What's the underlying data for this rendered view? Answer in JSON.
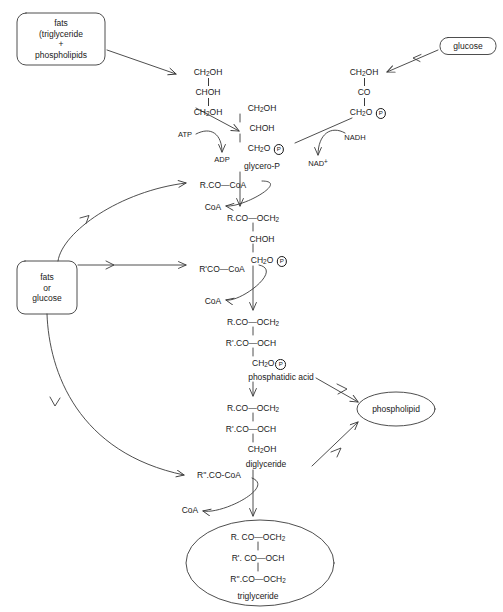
{
  "diagram": {
    "stroke_color": "#3a3a3a",
    "text_color": "#1a1a1a",
    "background": "#ffffff"
  },
  "boxes": [
    {
      "id": "fats-phospholipids",
      "shape": "rounded-rect",
      "lines": [
        "fats",
        "(triglyceride",
        "+",
        "phospholipids"
      ],
      "x": 61,
      "y": 39,
      "w": 88,
      "h": 52
    },
    {
      "id": "glucose",
      "shape": "rounded-rect",
      "lines": [
        "glucose"
      ],
      "x": 468,
      "y": 46,
      "w": 56,
      "h": 17
    },
    {
      "id": "fats-or-glucose",
      "shape": "rounded-rect",
      "lines": [
        "fats",
        "or",
        "glucose"
      ],
      "x": 47,
      "y": 288,
      "w": 60,
      "h": 53
    },
    {
      "id": "phospholipid",
      "shape": "ellipse",
      "lines": [
        "phospholipid"
      ],
      "x": 396,
      "y": 409,
      "w": 78,
      "h": 34
    },
    {
      "id": "triglyceride",
      "shape": "ellipse",
      "lines": [],
      "x": 260,
      "y": 563,
      "w": 148,
      "h": 86
    }
  ],
  "labels": [
    {
      "id": "glycerol-c1",
      "text": "CH2OH",
      "x": 208,
      "y": 73,
      "align": "center"
    },
    {
      "id": "glycerol-c2",
      "text": "CHOH",
      "x": 208,
      "y": 93,
      "align": "center"
    },
    {
      "id": "glycerol-c3",
      "text": "CH2OH",
      "x": 208,
      "y": 113,
      "align": "center"
    },
    {
      "id": "atp",
      "text": "ATP",
      "x": 185,
      "y": 135,
      "align": "center"
    },
    {
      "id": "adp",
      "text": "ADP",
      "x": 222,
      "y": 160,
      "align": "center"
    },
    {
      "id": "glycerop-c1",
      "text": "CH2OH",
      "x": 262,
      "y": 109,
      "align": "center"
    },
    {
      "id": "glycerop-c2",
      "text": "CHOH",
      "x": 262,
      "y": 129,
      "align": "center"
    },
    {
      "id": "glycerop-c3",
      "text": "CH2O P",
      "x": 262,
      "y": 149,
      "align": "center"
    },
    {
      "id": "glycerop-name",
      "text": "glycero-P",
      "x": 262,
      "y": 166,
      "align": "center"
    },
    {
      "id": "dhap-c1",
      "text": "CH2OH",
      "x": 364,
      "y": 73,
      "align": "center"
    },
    {
      "id": "dhap-c2",
      "text": "CO",
      "x": 364,
      "y": 93,
      "align": "center"
    },
    {
      "id": "dhap-c3",
      "text": "CH2O P",
      "x": 364,
      "y": 113,
      "align": "center"
    },
    {
      "id": "nadh",
      "text": "NADH",
      "x": 355,
      "y": 138,
      "align": "center"
    },
    {
      "id": "nad-plus",
      "text": "NAD+",
      "x": 318,
      "y": 163,
      "align": "center"
    },
    {
      "id": "acyl-coa-1",
      "text": "R.CO—CoA",
      "x": 223,
      "y": 185,
      "align": "center"
    },
    {
      "id": "coa-1",
      "text": "CoA",
      "x": 213,
      "y": 207,
      "align": "center"
    },
    {
      "id": "lpa-c1",
      "text": "R.CO—OCH2",
      "x": 253,
      "y": 218,
      "align": "center"
    },
    {
      "id": "lpa-c2",
      "text": "CHOH",
      "x": 262,
      "y": 239,
      "align": "center"
    },
    {
      "id": "lpa-c3",
      "text": "CH2O P",
      "x": 265,
      "y": 260,
      "align": "center"
    },
    {
      "id": "acyl-coa-2",
      "text": "R'CO—CoA",
      "x": 222,
      "y": 269,
      "align": "center"
    },
    {
      "id": "coa-2",
      "text": "CoA",
      "x": 213,
      "y": 301,
      "align": "center"
    },
    {
      "id": "pa-c1",
      "text": "R.CO—OCH2",
      "x": 253,
      "y": 322,
      "align": "center"
    },
    {
      "id": "pa-c2",
      "text": "R'.CO—OCH",
      "x": 251,
      "y": 343,
      "align": "center"
    },
    {
      "id": "pa-c3",
      "text": "CH2O P",
      "x": 265,
      "y": 363,
      "align": "center"
    },
    {
      "id": "pa-name",
      "text": "phosphatidic acid",
      "x": 281,
      "y": 377,
      "align": "center"
    },
    {
      "id": "dg-c1",
      "text": "R.CO—OCH2",
      "x": 253,
      "y": 408,
      "align": "center"
    },
    {
      "id": "dg-c2",
      "text": "R'.CO—OCH",
      "x": 251,
      "y": 429,
      "align": "center"
    },
    {
      "id": "dg-c3",
      "text": "CH2OH",
      "x": 262,
      "y": 449,
      "align": "center"
    },
    {
      "id": "dg-name",
      "text": "diglyceride",
      "x": 266,
      "y": 464,
      "align": "center"
    },
    {
      "id": "acyl-coa-3",
      "text": "R''.CO-CoA",
      "x": 219,
      "y": 475,
      "align": "center"
    },
    {
      "id": "coa-3",
      "text": "CoA",
      "x": 190,
      "y": 510,
      "align": "center"
    },
    {
      "id": "tg-c1",
      "text": "R. CO—OCH2",
      "x": 258,
      "y": 537,
      "align": "center"
    },
    {
      "id": "tg-c2",
      "text": "R'. CO—OCH",
      "x": 258,
      "y": 558,
      "align": "center"
    },
    {
      "id": "tg-c3",
      "text": "R''.CO—OCH2",
      "x": 258,
      "y": 579,
      "align": "center"
    },
    {
      "id": "tg-name",
      "text": "triglyceride",
      "x": 258,
      "y": 596,
      "align": "center"
    }
  ]
}
